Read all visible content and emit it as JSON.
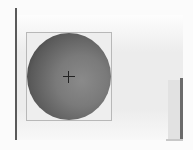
{
  "canvas": {
    "background": "#ececec",
    "object": {
      "type": "sphere",
      "fill_dark": "#2e2e2e",
      "fill_light": "#8a8a8a",
      "frame_color": "#b8b8b8",
      "center_marker": "crosshair-icon"
    }
  },
  "scrollbar": {
    "orientation": "vertical",
    "thumb_color": "#6a6a6a"
  }
}
